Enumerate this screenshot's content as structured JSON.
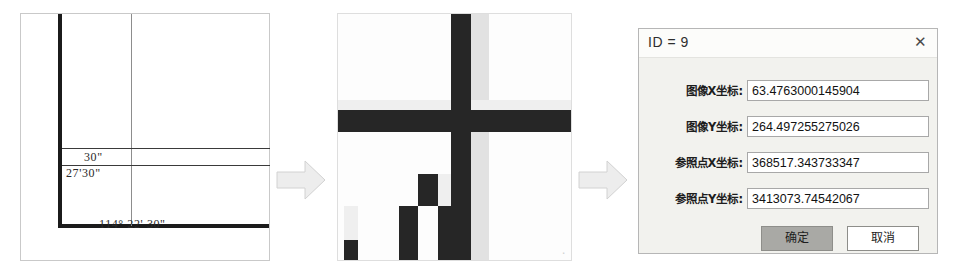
{
  "figure": {
    "panels": [
      {
        "id": "map-corner",
        "role": "source-map-sheet"
      },
      {
        "id": "zoomed-pixels",
        "role": "magnified-grid-intersection"
      },
      {
        "id": "coordinate-dialog",
        "role": "reference-point-entry"
      }
    ],
    "flow_arrows": 2
  },
  "map_panel": {
    "name": "map-corner-panel",
    "labels": {
      "lat_seconds": "30\"",
      "lat_minutes_seconds": "27'30\"",
      "longitude": "114° 22' 30\""
    }
  },
  "zoom_panel": {
    "name": "zoomed-pixel-panel",
    "watermark": "▫"
  },
  "dialog": {
    "title": "ID = 9",
    "close_label": "✕",
    "fields": [
      {
        "label": "图像X坐标:",
        "value": "63.4763000145904",
        "name": "image-x-coordinate"
      },
      {
        "label": "图像Y坐标:",
        "value": "264.497255275026",
        "name": "image-y-coordinate"
      },
      {
        "label": "参照点X坐标:",
        "value": "368517.343733347",
        "name": "reference-point-x-coordinate"
      },
      {
        "label": "参照点Y坐标:",
        "value": "3413073.74542067",
        "name": "reference-point-y-coordinate"
      }
    ],
    "buttons": {
      "ok": "确定",
      "cancel": "取消"
    }
  },
  "colors": {
    "page_background": "#ffffff",
    "neatline": "#1b1b1b",
    "graticule": "#8d8d8d",
    "arrow_fill": "#ededed",
    "arrow_stroke": "#cfcfcf",
    "dialog_background": "#f2f2ee",
    "dialog_border": "#b6b6b6",
    "input_background": "#ffffff",
    "ok_button_fill": "#a9a9a5",
    "pixel_dark": "#262626",
    "pixel_light": "#efefef"
  }
}
